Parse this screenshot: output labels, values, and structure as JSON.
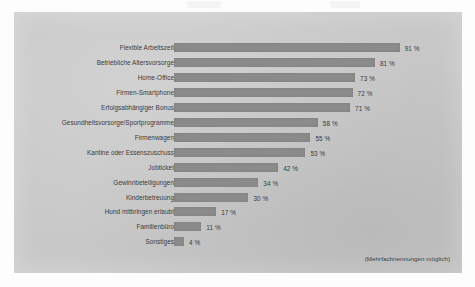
{
  "figure": {
    "footnote": "(Mehrfachnennungen möglich)",
    "panel_color": "#c8c8c8",
    "bar_color": "#8b8b8b",
    "text_color": "#3a3a3a"
  },
  "chart_data": {
    "type": "bar",
    "orientation": "horizontal",
    "title": "",
    "subtitle": "",
    "xlabel": "",
    "ylabel": "",
    "xlim": [
      0,
      100
    ],
    "grid": false,
    "legend": false,
    "value_suffix": " %",
    "annotations": [
      "(Mehrfachnennungen möglich)"
    ],
    "categories": [
      "Flexible Arbeitszeit",
      "Betriebliche Altersvorsorge",
      "Home-Office",
      "Firmen-Smartphone",
      "Erfolgsabhängiger Bonus",
      "Gesundheitsvorsorge/Sportprogramme",
      "Firmenwagen",
      "Kantine oder Essenszuschuss",
      "Jobticket",
      "Gewinnbeteiligungen",
      "Kinderbetreuung",
      "Hund mitbringen erlaubt",
      "Familienbüro",
      "Sonstiges"
    ],
    "values": [
      91,
      81,
      73,
      72,
      71,
      58,
      55,
      53,
      42,
      34,
      30,
      17,
      11,
      4
    ],
    "value_labels": [
      "91 %",
      "81 %",
      "73 %",
      "72 %",
      "71 %",
      "58 %",
      "55 %",
      "53 %",
      "42 %",
      "34 %",
      "30 %",
      "17 %",
      "11 %",
      "4 %"
    ]
  }
}
